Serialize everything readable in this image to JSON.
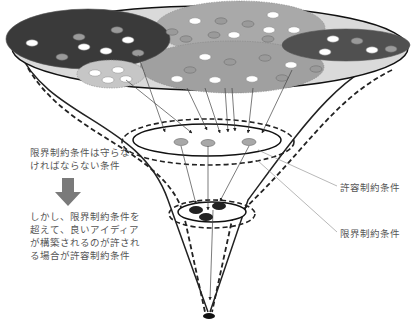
{
  "notes": {
    "limit_rule_line1": "限界制約条件は守らな",
    "limit_rule_line2": "ければならない条件",
    "allow_rule_line1": "しかし、限界制約条件を",
    "allow_rule_line2": "超えて、良いアイディア",
    "allow_rule_line3": "が構築されるのが許され",
    "allow_rule_line4": "る場合が許容制約条件"
  },
  "labels": {
    "allowable_constraint": "許容制約条件",
    "limit_constraint": "限界制約条件"
  },
  "icons": {
    "down_arrow": "down-arrow-icon"
  },
  "colors": {
    "top_disc": "#d9d9d9",
    "dark_cluster": "#3a3a3a",
    "mid_cluster": "#a3a3a3",
    "light_cluster": "#c4c4c4",
    "white_dot": "#ffffff",
    "gray_dot": "#9a9a9a",
    "arrow_gray": "#808080",
    "text": "#555555"
  }
}
